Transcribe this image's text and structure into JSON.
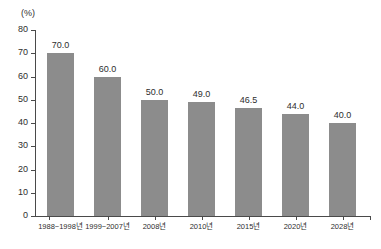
{
  "chart_data": {
    "type": "bar",
    "title": "",
    "subtitle": "",
    "xlabel": "",
    "ylabel": "",
    "unit_label": "(%)",
    "categories": [
      "1988~1998년",
      "1999~2007년",
      "2008년",
      "2010년",
      "2015년",
      "2020년",
      "2028년"
    ],
    "values": [
      70.0,
      60.0,
      50.0,
      49.0,
      46.5,
      44.0,
      40.0
    ],
    "value_labels": [
      "70.0",
      "60.0",
      "50.0",
      "49.0",
      "46.5",
      "44.0",
      "40.0"
    ],
    "ylim": [
      0,
      80
    ],
    "ytick_labels": [
      "80",
      "70",
      "60",
      "50",
      "40",
      "30",
      "20",
      "10",
      "0"
    ],
    "ytick_values": [
      80,
      70,
      60,
      50,
      40,
      30,
      20,
      10,
      0
    ],
    "grid": false,
    "legend": [],
    "legend_position": "none",
    "series": [
      {
        "name": "",
        "values": [
          70.0,
          60.0,
          50.0,
          49.0,
          46.5,
          44.0,
          40.0
        ],
        "color": "#8c8c8c"
      }
    ],
    "colors": {
      "bar": "#8c8c8c",
      "axis": "#4a4a4a",
      "text": "#2e2e2e",
      "background": "#ffffff"
    }
  }
}
